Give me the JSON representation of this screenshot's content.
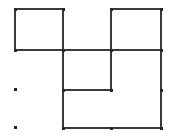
{
  "figure": {
    "type": "line-drawing",
    "title": "",
    "width": 173,
    "height": 136,
    "background_color": "#ffffff",
    "stroke_color": "#3a3a3a",
    "stroke_width": 1.4,
    "marker_color": "#262626",
    "marker_size": 3,
    "rectangles": [
      {
        "name": "top-left-square",
        "x": 15,
        "y": 9,
        "width": 48,
        "height": 41,
        "label": ""
      },
      {
        "name": "top-right-rectangle",
        "x": 111,
        "y": 9,
        "width": 50,
        "height": 41,
        "label": ""
      },
      {
        "name": "middle-square",
        "x": 63,
        "y": 50,
        "width": 48,
        "height": 40,
        "label": ""
      },
      {
        "name": "bottom-right-rectangle",
        "x": 63,
        "y": 90,
        "width": 98,
        "height": 38,
        "label": ""
      }
    ],
    "segments": [
      {
        "name": "top-edge-left-square",
        "x1": 15,
        "y1": 9,
        "x2": 63,
        "y2": 9
      },
      {
        "name": "left-edge-left-square",
        "x1": 15,
        "y1": 9,
        "x2": 15,
        "y2": 50
      },
      {
        "name": "bottom-edge-left-square",
        "x1": 15,
        "y1": 50,
        "x2": 63,
        "y2": 50
      },
      {
        "name": "shared-vertical-x63-upper",
        "x1": 63,
        "y1": 9,
        "x2": 63,
        "y2": 50
      },
      {
        "name": "top-edge-right-rect",
        "x1": 111,
        "y1": 9,
        "x2": 161,
        "y2": 9
      },
      {
        "name": "left-edge-right-rect",
        "x1": 111,
        "y1": 9,
        "x2": 111,
        "y2": 50
      },
      {
        "name": "right-edge-right-rect",
        "x1": 161,
        "y1": 9,
        "x2": 161,
        "y2": 128
      },
      {
        "name": "mid-horizontal-y50",
        "x1": 63,
        "y1": 50,
        "x2": 161,
        "y2": 50
      },
      {
        "name": "shared-vertical-x63-lower",
        "x1": 63,
        "y1": 50,
        "x2": 63,
        "y2": 128
      },
      {
        "name": "vertical-x111-middle",
        "x1": 111,
        "y1": 50,
        "x2": 111,
        "y2": 90
      },
      {
        "name": "horizontal-y90",
        "x1": 63,
        "y1": 90,
        "x2": 111,
        "y2": 90
      },
      {
        "name": "bottom-edge-y128",
        "x1": 63,
        "y1": 128,
        "x2": 161,
        "y2": 128
      }
    ],
    "vertex_markers": [
      {
        "name": "vertex-top-left",
        "x": 15,
        "y": 9
      },
      {
        "name": "vertex-top-mid",
        "x": 63,
        "y": 9
      },
      {
        "name": "vertex-top-right-rect-left",
        "x": 111,
        "y": 9
      },
      {
        "name": "vertex-top-right",
        "x": 161,
        "y": 9
      },
      {
        "name": "vertex-left-mid",
        "x": 15,
        "y": 50
      },
      {
        "name": "vertex-center-cross",
        "x": 63,
        "y": 50
      },
      {
        "name": "vertex-mid-tee",
        "x": 111,
        "y": 50
      },
      {
        "name": "vertex-right-mid",
        "x": 161,
        "y": 50
      },
      {
        "name": "vertex-inner-bottom-left",
        "x": 63,
        "y": 90
      },
      {
        "name": "vertex-inner-bottom-right",
        "x": 111,
        "y": 90
      },
      {
        "name": "vertex-right-lower",
        "x": 161,
        "y": 90
      },
      {
        "name": "vertex-bottom-left",
        "x": 63,
        "y": 128
      },
      {
        "name": "vertex-bottom-mid",
        "x": 111,
        "y": 128
      },
      {
        "name": "vertex-bottom-right",
        "x": 161,
        "y": 128
      }
    ],
    "isolated_dots": [
      {
        "name": "isolated-dot-upper",
        "x": 15,
        "y": 89
      },
      {
        "name": "isolated-dot-lower",
        "x": 15,
        "y": 127
      }
    ]
  }
}
